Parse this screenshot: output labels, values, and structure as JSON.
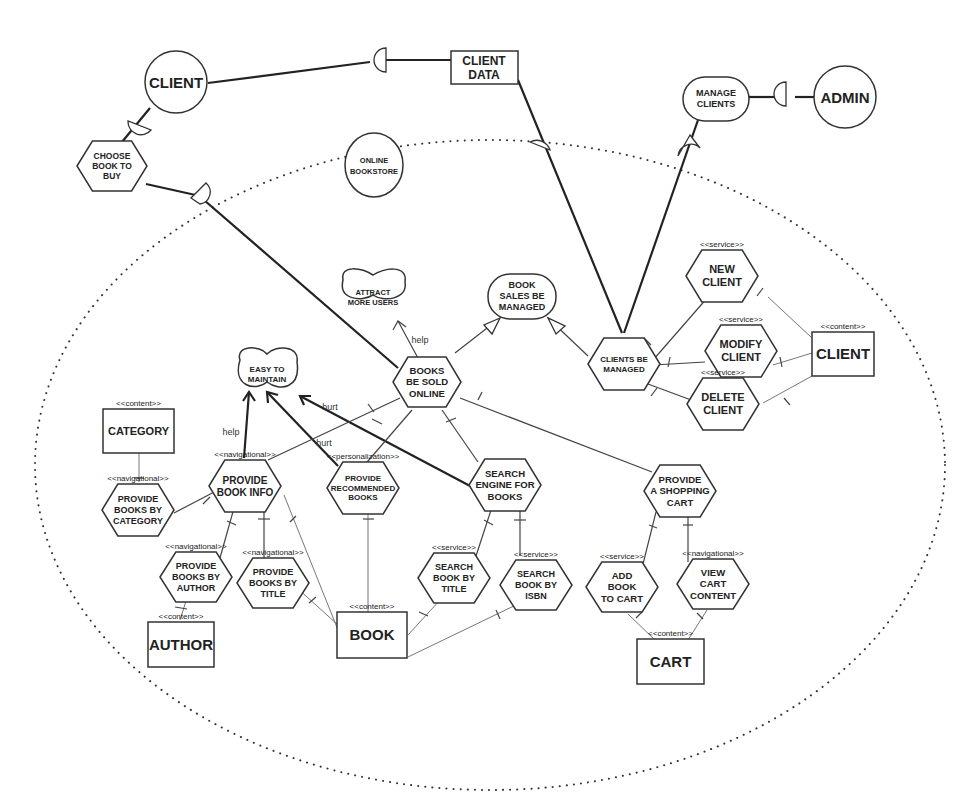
{
  "diagram": {
    "boundary_label": "ONLINE BOOKSTORE",
    "actors": [
      {
        "id": "client_actor",
        "label": "CLIENT"
      },
      {
        "id": "admin_actor",
        "label": "ADMIN"
      },
      {
        "id": "online_bookstore",
        "label": "ONLINE BOOKSTORE"
      }
    ],
    "resources_external": [
      {
        "id": "client_data",
        "label": "CLIENT DATA"
      }
    ],
    "goals": [
      {
        "id": "manage_clients",
        "label": "MANAGE CLIENTS"
      },
      {
        "id": "book_sales_managed",
        "label": "BOOK SALES BE MANAGED"
      }
    ],
    "softgoals": [
      {
        "id": "attract_users",
        "label": "ATTRACT MORE USERS"
      },
      {
        "id": "easy_maintain",
        "label": "EASY TO MAINTAIN"
      }
    ],
    "tasks": [
      {
        "id": "choose_book",
        "label": "CHOOSE BOOK TO BUY",
        "stereotype": ""
      },
      {
        "id": "books_sold",
        "label": "BOOKS BE SOLD ONLINE",
        "stereotype": ""
      },
      {
        "id": "clients_managed",
        "label": "CLIENTS BE MANAGED",
        "stereotype": ""
      },
      {
        "id": "new_client",
        "label": "NEW CLIENT",
        "stereotype": "<<service>>"
      },
      {
        "id": "modify_client",
        "label": "MODIFY CLIENT",
        "stereotype": "<<service>>"
      },
      {
        "id": "delete_client",
        "label": "DELETE CLIENT",
        "stereotype": "<<service>>"
      },
      {
        "id": "provide_book_info",
        "label": "PROVIDE BOOK INFO",
        "stereotype": "<<navigational>>"
      },
      {
        "id": "provide_recommended",
        "label": "PROVIDE RECOMMENDED BOOKS",
        "stereotype": "<<personalization>>"
      },
      {
        "id": "search_engine",
        "label": "SEARCH ENGINE FOR BOOKS",
        "stereotype": ""
      },
      {
        "id": "shopping_cart",
        "label": "PROVIDE A SHOPPING CART",
        "stereotype": ""
      },
      {
        "id": "books_by_category",
        "label": "PROVIDE BOOKS BY CATEGORY",
        "stereotype": "<<navigational>>"
      },
      {
        "id": "books_by_author",
        "label": "PROVIDE BOOKS BY AUTHOR",
        "stereotype": "<<navigational>>"
      },
      {
        "id": "books_by_title",
        "label": "PROVIDE BOOKS BY TITLE",
        "stereotype": "<<navigational>>"
      },
      {
        "id": "search_by_title",
        "label": "SEARCH BOOK BY TITLE",
        "stereotype": "<<service>>"
      },
      {
        "id": "search_by_isbn",
        "label": "SEARCH BOOK BY ISBN",
        "stereotype": "<<service>>"
      },
      {
        "id": "add_to_cart",
        "label": "ADD BOOK TO CART",
        "stereotype": "<<service>>"
      },
      {
        "id": "view_cart",
        "label": "VIEW CART CONTENT",
        "stereotype": "<<navigational>>"
      }
    ],
    "resources": [
      {
        "id": "client_res",
        "label": "CLIENT",
        "stereotype": "<<content>>"
      },
      {
        "id": "category_res",
        "label": "CATEGORY",
        "stereotype": "<<content>>"
      },
      {
        "id": "author_res",
        "label": "AUTHOR",
        "stereotype": "<<content>>"
      },
      {
        "id": "book_res",
        "label": "BOOK",
        "stereotype": "<<content>>"
      },
      {
        "id": "cart_res",
        "label": "CART",
        "stereotype": "<<content>>"
      }
    ],
    "contributions": {
      "help": "help",
      "hurt": "hurt"
    },
    "links": [
      {
        "from": "client_actor",
        "to": "client_data",
        "type": "dependency"
      },
      {
        "from": "client_actor",
        "to": "choose_book",
        "type": "dependency"
      },
      {
        "from": "choose_book",
        "to": "books_sold",
        "type": "dependency"
      },
      {
        "from": "client_data",
        "to": "clients_managed",
        "type": "dependency"
      },
      {
        "from": "admin_actor",
        "to": "manage_clients",
        "type": "dependency"
      },
      {
        "from": "manage_clients",
        "to": "clients_managed",
        "type": "dependency"
      },
      {
        "from": "books_sold",
        "to": "book_sales_managed",
        "type": "means-end"
      },
      {
        "from": "clients_managed",
        "to": "book_sales_managed",
        "type": "means-end"
      },
      {
        "from": "books_sold",
        "to": "attract_users",
        "type": "contribution",
        "label": "help"
      },
      {
        "from": "provide_book_info",
        "to": "easy_maintain",
        "type": "contribution",
        "label": "help"
      },
      {
        "from": "provide_recommended",
        "to": "easy_maintain",
        "type": "contribution",
        "label": "hurt"
      },
      {
        "from": "search_engine",
        "to": "easy_maintain",
        "type": "contribution",
        "label": "hurt"
      }
    ]
  }
}
